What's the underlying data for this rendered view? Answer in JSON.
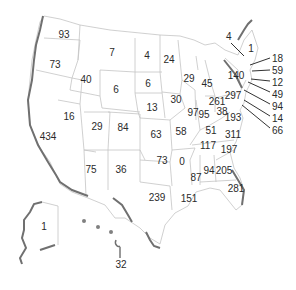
{
  "map": {
    "type": "US state choropleth-style count map",
    "colors": {
      "border": "#b8b8b8",
      "coast": "#6e6e6e",
      "label": "#2a2a2a",
      "background": "#ffffff"
    },
    "states": [
      {
        "id": "WA",
        "value": "93",
        "x": 64,
        "y": 35
      },
      {
        "id": "OR",
        "value": "73",
        "x": 55,
        "y": 65
      },
      {
        "id": "ID",
        "value": "40",
        "x": 86,
        "y": 80
      },
      {
        "id": "MT",
        "value": "7",
        "x": 112,
        "y": 53
      },
      {
        "id": "WY",
        "value": "6",
        "x": 116,
        "y": 90
      },
      {
        "id": "CA",
        "value": "434",
        "x": 48,
        "y": 137
      },
      {
        "id": "NV",
        "value": "16",
        "x": 69,
        "y": 117
      },
      {
        "id": "UT",
        "value": "29",
        "x": 97,
        "y": 127
      },
      {
        "id": "CO",
        "value": "84",
        "x": 123,
        "y": 128
      },
      {
        "id": "AZ",
        "value": "75",
        "x": 91,
        "y": 170
      },
      {
        "id": "NM",
        "value": "36",
        "x": 121,
        "y": 170
      },
      {
        "id": "ND",
        "value": "4",
        "x": 147,
        "y": 56
      },
      {
        "id": "SD",
        "value": "6",
        "x": 148,
        "y": 84
      },
      {
        "id": "NE",
        "value": "13",
        "x": 152,
        "y": 108
      },
      {
        "id": "KS",
        "value": "63",
        "x": 156,
        "y": 135
      },
      {
        "id": "OK",
        "value": "73",
        "x": 162,
        "y": 161
      },
      {
        "id": "TX",
        "value": "239",
        "x": 157,
        "y": 198
      },
      {
        "id": "MN",
        "value": "24",
        "x": 169,
        "y": 60
      },
      {
        "id": "IA",
        "value": "30",
        "x": 176,
        "y": 100
      },
      {
        "id": "MO",
        "value": "58",
        "x": 181,
        "y": 132
      },
      {
        "id": "AR",
        "value": "0",
        "x": 182,
        "y": 162
      },
      {
        "id": "LA",
        "value": "151",
        "x": 189,
        "y": 199
      },
      {
        "id": "WI",
        "value": "29",
        "x": 189,
        "y": 79
      },
      {
        "id": "MI",
        "value": "45",
        "x": 207,
        "y": 84
      },
      {
        "id": "IL",
        "value": "97",
        "x": 193,
        "y": 113
      },
      {
        "id": "IN",
        "value": "95",
        "x": 204,
        "y": 115
      },
      {
        "id": "OH",
        "value": "261",
        "x": 217,
        "y": 102
      },
      {
        "id": "KY",
        "value": "51",
        "x": 211,
        "y": 131
      },
      {
        "id": "TN",
        "value": "117",
        "x": 208,
        "y": 146
      },
      {
        "id": "MS",
        "value": "87",
        "x": 196,
        "y": 178
      },
      {
        "id": "AL",
        "value": "94",
        "x": 209,
        "y": 171
      },
      {
        "id": "GA",
        "value": "205",
        "x": 224,
        "y": 171
      },
      {
        "id": "FL",
        "value": "281",
        "x": 236,
        "y": 189
      },
      {
        "id": "SC",
        "value": "197",
        "x": 229,
        "y": 150
      },
      {
        "id": "NC",
        "value": "311",
        "x": 233,
        "y": 135
      },
      {
        "id": "VA",
        "value": "193",
        "x": 233,
        "y": 118
      },
      {
        "id": "WV",
        "value": "38",
        "x": 222,
        "y": 112
      },
      {
        "id": "PA",
        "value": "297",
        "x": 233,
        "y": 96
      },
      {
        "id": "NY",
        "value": "140",
        "x": 236,
        "y": 76
      },
      {
        "id": "ME",
        "value": "1",
        "x": 251,
        "y": 49
      },
      {
        "id": "AK",
        "value": "1",
        "x": 44,
        "y": 227
      },
      {
        "id": "HI",
        "value": "32",
        "x": 121,
        "y": 265
      }
    ],
    "callouts": [
      {
        "id": "VT",
        "value": "4",
        "label_x": 226,
        "label_y": 36,
        "line": [
          231,
          43,
          244,
          56
        ]
      },
      {
        "id": "NH",
        "value": "18",
        "label_x": 272,
        "label_y": 54,
        "line": [
          270,
          58,
          250,
          65
        ]
      },
      {
        "id": "MA",
        "value": "59",
        "label_x": 272,
        "label_y": 66,
        "line": [
          270,
          70,
          252,
          71
        ]
      },
      {
        "id": "RI",
        "value": "12",
        "label_x": 272,
        "label_y": 78,
        "line": [
          270,
          81,
          251,
          79
        ]
      },
      {
        "id": "CT",
        "value": "49",
        "label_x": 272,
        "label_y": 90,
        "line": [
          270,
          92,
          248,
          82
        ]
      },
      {
        "id": "NJ",
        "value": "94",
        "label_x": 272,
        "label_y": 102,
        "line": [
          270,
          104,
          244,
          90
        ]
      },
      {
        "id": "DE",
        "value": "14",
        "label_x": 272,
        "label_y": 114,
        "line": [
          270,
          116,
          244,
          100
        ]
      },
      {
        "id": "MD",
        "value": "66",
        "label_x": 272,
        "label_y": 126,
        "line": [
          270,
          128,
          242,
          105
        ]
      },
      {
        "id": "HI-arrow",
        "value": "",
        "label_x": 0,
        "label_y": 0,
        "line": [
          120,
          258,
          120,
          247
        ]
      }
    ]
  }
}
